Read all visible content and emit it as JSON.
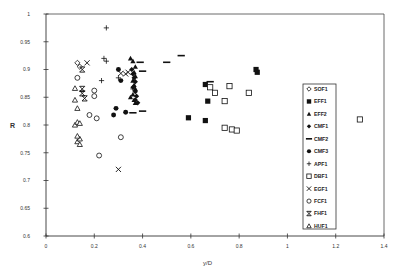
{
  "chart_data": {
    "type": "scatter",
    "title": "",
    "xlabel": "y/D",
    "ylabel": "R",
    "xlim": [
      0,
      1.4
    ],
    "ylim": [
      0.6,
      1.0
    ],
    "xticks": [
      "0",
      "0.2",
      "0.4",
      "0.6",
      "0.8",
      "1",
      "1.2",
      "1.4"
    ],
    "yticks": [
      "0.6",
      "0.65",
      "0.7",
      "0.75",
      "0.8",
      "0.85",
      "0.9",
      "0.95",
      "1"
    ],
    "grid": false,
    "legend_position": "inside-right",
    "series": [
      {
        "name": "SOF1",
        "marker": "diamond-open",
        "points": [
          [
            0.13,
            0.912
          ],
          [
            0.14,
            0.905
          ]
        ]
      },
      {
        "name": "EFF1",
        "marker": "square-filled",
        "points": [
          [
            0.59,
            0.813
          ],
          [
            0.66,
            0.873
          ],
          [
            0.67,
            0.843
          ],
          [
            0.66,
            0.808
          ],
          [
            0.87,
            0.9
          ],
          [
            0.875,
            0.895
          ]
        ]
      },
      {
        "name": "EFF2",
        "marker": "triangle-filled",
        "points": [
          [
            0.35,
            0.92
          ],
          [
            0.36,
            0.915
          ],
          [
            0.37,
            0.905
          ],
          [
            0.365,
            0.895
          ],
          [
            0.37,
            0.888
          ],
          [
            0.36,
            0.88
          ],
          [
            0.365,
            0.872
          ],
          [
            0.37,
            0.865
          ],
          [
            0.36,
            0.855
          ],
          [
            0.365,
            0.845
          ],
          [
            0.35,
            0.85
          ],
          [
            0.37,
            0.84
          ]
        ]
      },
      {
        "name": "CMF1",
        "marker": "diamond-filled",
        "points": [
          [
            0.355,
            0.9
          ],
          [
            0.36,
            0.892
          ],
          [
            0.365,
            0.885
          ],
          [
            0.37,
            0.878
          ],
          [
            0.36,
            0.868
          ],
          [
            0.37,
            0.86
          ],
          [
            0.375,
            0.852
          ],
          [
            0.37,
            0.845
          ],
          [
            0.38,
            0.84
          ]
        ]
      },
      {
        "name": "CMF2",
        "marker": "dash",
        "points": [
          [
            0.39,
            0.913
          ],
          [
            0.4,
            0.897
          ],
          [
            0.36,
            0.822
          ],
          [
            0.4,
            0.825
          ],
          [
            0.5,
            0.913
          ],
          [
            0.56,
            0.925
          ],
          [
            0.68,
            0.878
          ]
        ]
      },
      {
        "name": "CMF3",
        "marker": "circle-filled",
        "points": [
          [
            0.3,
            0.9
          ],
          [
            0.29,
            0.83
          ],
          [
            0.28,
            0.818
          ],
          [
            0.33,
            0.823
          ],
          [
            0.31,
            0.88
          ]
        ]
      },
      {
        "name": "APF1",
        "marker": "plus",
        "points": [
          [
            0.25,
            0.975
          ],
          [
            0.24,
            0.92
          ],
          [
            0.25,
            0.915
          ],
          [
            0.23,
            0.88
          ],
          [
            0.3,
            0.885
          ],
          [
            0.36,
            0.865
          ]
        ]
      },
      {
        "name": "DBF1",
        "marker": "square-open",
        "points": [
          [
            0.68,
            0.868
          ],
          [
            0.7,
            0.858
          ],
          [
            0.76,
            0.87
          ],
          [
            0.74,
            0.843
          ],
          [
            0.84,
            0.858
          ],
          [
            0.74,
            0.795
          ],
          [
            0.77,
            0.792
          ],
          [
            0.79,
            0.79
          ],
          [
            1.3,
            0.81
          ]
        ]
      },
      {
        "name": "EGF1",
        "marker": "x",
        "points": [
          [
            0.17,
            0.912
          ],
          [
            0.31,
            0.893
          ],
          [
            0.33,
            0.892
          ],
          [
            0.34,
            0.895
          ],
          [
            0.3,
            0.72
          ]
        ]
      },
      {
        "name": "FCF1",
        "marker": "circle-open",
        "points": [
          [
            0.13,
            0.885
          ],
          [
            0.2,
            0.862
          ],
          [
            0.2,
            0.852
          ],
          [
            0.18,
            0.818
          ],
          [
            0.21,
            0.812
          ],
          [
            0.31,
            0.778
          ],
          [
            0.22,
            0.745
          ]
        ]
      },
      {
        "name": "FHF1",
        "marker": "hourglass",
        "points": [
          [
            0.15,
            0.9
          ],
          [
            0.15,
            0.865
          ],
          [
            0.15,
            0.857
          ],
          [
            0.16,
            0.848
          ]
        ]
      },
      {
        "name": "HUF1",
        "marker": "triangle-open",
        "points": [
          [
            0.12,
            0.866
          ],
          [
            0.12,
            0.845
          ],
          [
            0.13,
            0.83
          ],
          [
            0.12,
            0.8
          ],
          [
            0.13,
            0.805
          ],
          [
            0.14,
            0.803
          ],
          [
            0.13,
            0.77
          ],
          [
            0.14,
            0.775
          ],
          [
            0.14,
            0.765
          ],
          [
            0.13,
            0.78
          ]
        ]
      }
    ]
  },
  "legend": {
    "items": [
      "SOF1",
      "EFF1",
      "EFF2",
      "CMF1",
      "CMF2",
      "CMF3",
      "APF1",
      "DBF1",
      "EGF1",
      "FCF1",
      "FHF1",
      "HUF1"
    ]
  },
  "axes": {
    "xlabel": "y/D",
    "ylabel": "R"
  }
}
